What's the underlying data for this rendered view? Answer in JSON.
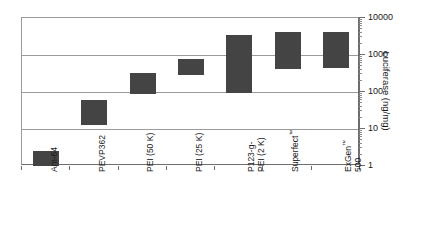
{
  "chart_data": {
    "type": "bar",
    "bar_style": "floating-range",
    "title": "",
    "subtitle": "",
    "xlabel": "",
    "ylabel": "Luciferase (ng/mg)",
    "yscale": "log",
    "ylim": [
      1,
      10000
    ],
    "ytick_labels": [
      "10000",
      "1000",
      "100",
      "10",
      "1"
    ],
    "ytick_values": [
      10000,
      1000,
      100,
      10,
      1
    ],
    "grid": true,
    "grid_axis": "y",
    "legend": false,
    "legend_position": "none",
    "axis_position": "right",
    "bar_color": "#444444",
    "grid_color": "#9a9a9a",
    "axis_color": "#6d6d6d",
    "categories": [
      "Am-64",
      "PEVP362",
      "PEI (50 K)",
      "PEI (25 K)",
      "P123-g-PEI (2 K)",
      "Superfect™",
      "ExGen™ 500"
    ],
    "category_lines": [
      [
        "Am-64"
      ],
      [
        "PEVP362"
      ],
      [
        "PEI (50 K)"
      ],
      [
        "PEI (25 K)"
      ],
      [
        "P123-g-",
        "PEI (2 K)"
      ],
      [
        "Superfect™"
      ],
      [
        "ExGen™",
        "500"
      ]
    ],
    "series": [
      {
        "name": "Luciferase expression range",
        "low": [
          1,
          13,
          90,
          280,
          95,
          420,
          450
        ],
        "high": [
          2.5,
          60,
          320,
          800,
          3500,
          4100,
          4200
        ]
      }
    ],
    "values_low": [
      1,
      13,
      90,
      280,
      95,
      420,
      450
    ],
    "values_high": [
      2.5,
      60,
      320,
      800,
      3500,
      4100,
      4200
    ]
  }
}
